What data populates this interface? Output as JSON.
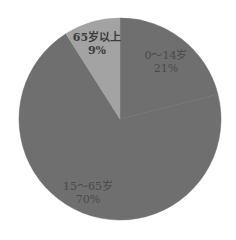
{
  "chart_data": {
    "type": "pie",
    "title": "",
    "categories": [
      "0～14岁",
      "15～65岁",
      "65岁以上"
    ],
    "values": [
      21,
      70,
      9
    ],
    "unit": "%",
    "labels": [
      {
        "name": "0～14岁",
        "value": "21%"
      },
      {
        "name": "15～65岁",
        "value": "70%"
      },
      {
        "name": "65岁以上",
        "value": "9%"
      }
    ],
    "colors": [
      "#6f6f6f",
      "#6f6f6f",
      "#a3a3a3"
    ],
    "start_angle_deg": 0,
    "direction": "clockwise",
    "legend": "none"
  },
  "geometry": {
    "cx": 120,
    "cy": 119,
    "r": 101
  },
  "text_color": "#4a4a4a"
}
